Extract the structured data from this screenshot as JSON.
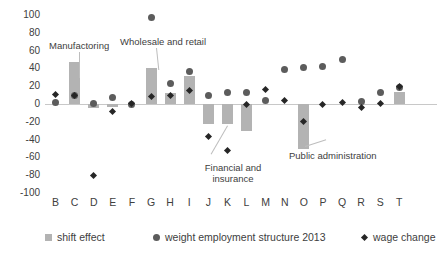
{
  "chart_data": {
    "type": "bar",
    "title": "",
    "xlabel": "",
    "ylabel": "",
    "ylim": [
      -100,
      100
    ],
    "grid": false,
    "legend_position": "bottom",
    "categories": [
      "B",
      "C",
      "D",
      "E",
      "F",
      "G",
      "H",
      "I",
      "J",
      "K",
      "L",
      "M",
      "N",
      "O",
      "P",
      "Q",
      "R",
      "S",
      "T"
    ],
    "ytick_labels": [
      "100",
      "80",
      "60",
      "40",
      "20",
      "0",
      "-20",
      "-40",
      "-60",
      "-80",
      "-100"
    ],
    "ytick_values": [
      100,
      80,
      60,
      40,
      20,
      0,
      -20,
      -40,
      -60,
      -80,
      -100
    ],
    "series": [
      {
        "name": "shift effect",
        "type": "bar",
        "color": "#b3b3b3",
        "values": [
          0,
          47,
          -5,
          -3,
          0,
          41,
          12,
          32,
          -22,
          -22,
          -30,
          0,
          0,
          -50,
          0,
          0,
          0,
          0,
          14
        ]
      },
      {
        "name": "weight employment structure 2013",
        "type": "scatter-circle",
        "color": "#5c5c5c",
        "values": [
          2,
          9,
          1,
          7,
          0,
          97,
          23,
          37,
          10,
          13,
          13,
          4,
          39,
          41,
          42,
          50,
          3,
          13,
          18
        ]
      },
      {
        "name": "wage change",
        "type": "scatter-diamond",
        "color": "#262626",
        "values": [
          11,
          9,
          -80,
          -8,
          1,
          8,
          9,
          15,
          -37,
          -52,
          0,
          16,
          4,
          -20,
          0,
          2,
          -4,
          1,
          20
        ]
      }
    ]
  },
  "annotations": [
    {
      "text": "Manufactoring",
      "target_category": "C"
    },
    {
      "text": "Wholesale and retail",
      "target_category": "G"
    },
    {
      "text": "Financial and insurance",
      "target_category": "K"
    },
    {
      "text": "Public administration",
      "target_category": "O"
    }
  ],
  "legend": {
    "items": [
      {
        "label": "shift effect",
        "marker": "square"
      },
      {
        "label": "weight employment structure 2013",
        "marker": "circle"
      },
      {
        "label": "wage change",
        "marker": "diamond"
      }
    ]
  }
}
